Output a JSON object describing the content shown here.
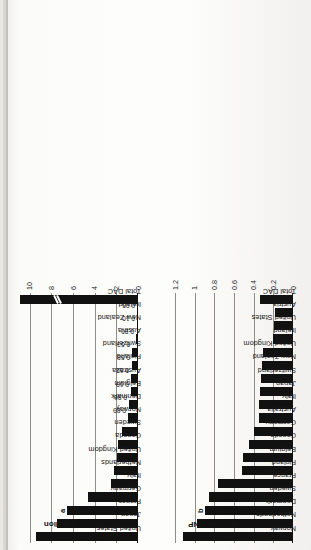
{
  "page": {
    "orientation": "rotated-90-ccw",
    "background_hex": "#f2f1ef",
    "bar_color_hex": "#111111",
    "grid_color_hex": "#8f8d8a"
  },
  "charts": [
    {
      "id": "dollar-billion",
      "unit_label": "$ Billion",
      "footnote_marker": "a",
      "footnote_marker_category": "France",
      "axis_ticks": [
        "0",
        "2",
        "4",
        "6",
        "8",
        "10"
      ],
      "axis_break_on_bar": "Total DAC",
      "chart_data": {
        "type": "bar",
        "title": "Net Official Development Assistance",
        "subtitle": "$ Billion",
        "xlabel": "",
        "ylabel": "$ Billion",
        "ylim": [
          0,
          10.9
        ],
        "grid": true,
        "legend": "none",
        "orientation": "vertical",
        "categories": [
          "United States",
          "Japan",
          "France",
          "Germany",
          "Italy",
          "Netherlands",
          "United Kingdom",
          "Canada",
          "Sweden",
          "Norway",
          "Denmark",
          "Belgium",
          "Australia",
          "Finland",
          "Switzerland",
          "Austria",
          "New Zealand",
          "Ireland",
          "Total DAC"
        ],
        "values": [
          9.4,
          7.45,
          6.52,
          4.58,
          2.53,
          2.22,
          1.92,
          1.89,
          1.51,
          0.89,
          0.86,
          0.69,
          0.62,
          0.58,
          0.53,
          0.2,
          0.1,
          0.05,
          10.9
        ],
        "data_labels": {
          "Norway": "0.89",
          "Denmark": "0.86",
          "Belgium": "0.69",
          "Australia": "0.62",
          "Finland": "0.58",
          "Switzerland": "0.53",
          "Austria": "0.20",
          "New Zealand": "0.10",
          "Ireland": "0.05"
        },
        "annotations": [
          {
            "text": "a",
            "category": "France"
          }
        ]
      }
    },
    {
      "id": "percent-of-gnp",
      "unit_label": "As % of GNP",
      "footnote_marker": "b",
      "footnote_marker_category": "Denmark",
      "axis_ticks": [
        "0",
        "0.2",
        "0.4",
        "0.6",
        "0.8",
        "1",
        "1.2"
      ],
      "chart_data": {
        "type": "bar",
        "title": "Net Official Development Assistance",
        "subtitle": "As % of GNP",
        "xlabel": "",
        "ylabel": "As % of GNP",
        "ylim": [
          0,
          1.2
        ],
        "grid": true,
        "legend": "none",
        "orientation": "vertical",
        "categories": [
          "Norway",
          "Netherlands",
          "Denmark",
          "Sweden",
          "France",
          "Finland",
          "Belgium",
          "Canada",
          "Germany",
          "Australia",
          "Italy",
          "Japan",
          "Switzerland",
          "New Zealand",
          "United Kingdom",
          "Ireland",
          "United States",
          "Austria",
          "Total DAC"
        ],
        "values": [
          1.12,
          0.98,
          0.9,
          0.85,
          0.76,
          0.52,
          0.51,
          0.45,
          0.4,
          0.35,
          0.35,
          0.34,
          0.33,
          0.32,
          0.31,
          0.2,
          0.19,
          0.18,
          0.34
        ],
        "annotations": [
          {
            "text": "b",
            "category": "Denmark"
          }
        ]
      }
    }
  ]
}
